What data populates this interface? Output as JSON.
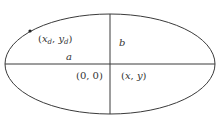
{
  "diagram": {
    "colors": {
      "stroke": "#3a3a3a",
      "text": "#333333",
      "background": "#ffffff"
    },
    "ellipse": {
      "cx": 110,
      "cy": 64,
      "rx": 105,
      "ry": 50
    },
    "point": {
      "x": 30,
      "y": 31
    },
    "labels": {
      "point": {
        "open": "(",
        "x": "x",
        "xsub": "d",
        "sep": ", ",
        "y": "y",
        "ysub": "d",
        "close": ")"
      },
      "semi_major": "a",
      "semi_minor": "b",
      "origin": "(0, 0)",
      "generic_point": {
        "open": "(",
        "x": "x",
        "sep": ", ",
        "y": "y",
        "close": ")"
      }
    }
  }
}
